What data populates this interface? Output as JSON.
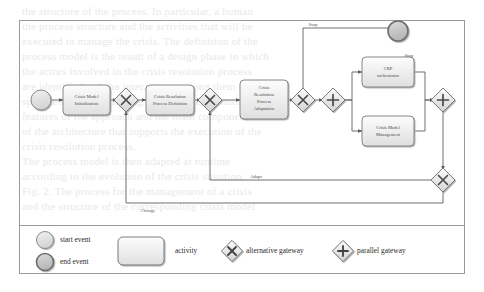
{
  "diagram": {
    "type": "bpmn-process-diagram",
    "colors": {
      "stroke": "#6f6f6f",
      "node_fill_top": "#fbfbfb",
      "node_fill_bottom": "#e3e3e3",
      "frame_stroke": "#9a9a9a",
      "text": "#4a4a4a",
      "end_event_fill": "#c9c9c9",
      "start_event_fill": "#dedede"
    },
    "events": {
      "start": {
        "name": "start-event"
      },
      "end": {
        "name": "end-event"
      }
    },
    "activities": [
      {
        "id": "a1",
        "label": "Crisis Model Initialization"
      },
      {
        "id": "a2",
        "label": "Crisis Resolution Process Definition"
      },
      {
        "id": "a3",
        "label": "Crisis Resolution Process Adaptation"
      },
      {
        "id": "a4",
        "label": "CRP orchestrator"
      },
      {
        "id": "a5",
        "label": "Crisis Model Management"
      }
    ],
    "gateways": [
      {
        "id": "g1",
        "kind": "alternative"
      },
      {
        "id": "g2",
        "kind": "alternative"
      },
      {
        "id": "g3",
        "kind": "alternative"
      },
      {
        "id": "g4",
        "kind": "parallel"
      },
      {
        "id": "g5",
        "kind": "parallel"
      },
      {
        "id": "g6",
        "kind": "alternative"
      }
    ],
    "flow_labels": {
      "stop_top": "Stop",
      "stop_end": "Stop",
      "adapt": "Adapt",
      "change": "Change"
    }
  },
  "legend": {
    "items": [
      {
        "shape": "start-event",
        "label": "start event"
      },
      {
        "shape": "end-event",
        "label": "end event"
      },
      {
        "shape": "activity",
        "label": "activity"
      },
      {
        "shape": "alternative-gateway",
        "label": "alternative gateway"
      },
      {
        "shape": "parallel-gateway",
        "label": "parallel gateway"
      }
    ]
  },
  "background_text": {
    "lines": [
      "the structure of the process. In particular, a human",
      "the process structure and the activities that will be",
      "executed to manage the crisis. The definition of the",
      "process model is the result of a design phase in which",
      "the actors involved in the crisis resolution process",
      "are identified and the interactions among them are",
      "specified. In the following we describe the main",
      "features of the approach and the main components",
      "of the architecture that supports the execution of the",
      "crisis resolution process.",
      "",
      "",
      "",
      "",
      "",
      "",
      "",
      "The process model is then adapted at runtime",
      "according to the evolution of the crisis situation.",
      "",
      "",
      "",
      "",
      "",
      "",
      "",
      "",
      "Fig. 2. The process for the management of a crisis",
      "and the structure of the corresponding crisis model"
    ]
  }
}
